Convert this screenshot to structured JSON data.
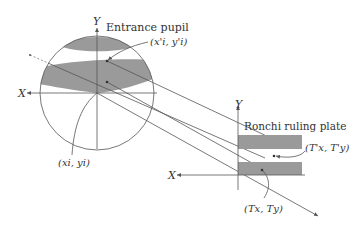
{
  "diagram": {
    "entrance_pupil_label": "Entrance pupil",
    "ronchi_label": "Ronchi ruling plate",
    "pupil_axes": {
      "x": "X",
      "y": "Y"
    },
    "plate_axes": {
      "x": "X",
      "y": "Y"
    },
    "points": {
      "pupil_point_prime": "(x'i, y'i)",
      "pupil_point": "(xi, yi)",
      "plate_point_prime": "(T'x, T'y)",
      "plate_point": "(Tx, Ty)"
    },
    "colors": {
      "line": "#555555",
      "shade": "#9a9a9a",
      "text": "#333333"
    }
  }
}
